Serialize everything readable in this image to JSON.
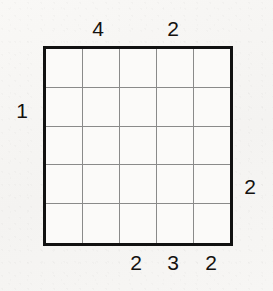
{
  "puzzle": {
    "type": "skyscrapers-grid",
    "grid": {
      "rows": 5,
      "columns": 5,
      "cells": [
        [
          "",
          "",
          "",
          "",
          ""
        ],
        [
          "",
          "",
          "",
          "",
          ""
        ],
        [
          "",
          "",
          "",
          "",
          ""
        ],
        [
          "",
          "",
          "",
          "",
          ""
        ],
        [
          "",
          "",
          "",
          "",
          ""
        ]
      ]
    },
    "clues": {
      "top": [
        {
          "column": 2,
          "value": "4"
        },
        {
          "column": 4,
          "value": "2"
        }
      ],
      "bottom": [
        {
          "column": 3,
          "value": "2"
        },
        {
          "column": 4,
          "value": "3"
        },
        {
          "column": 5,
          "value": "2"
        }
      ],
      "left": [
        {
          "row": 2,
          "value": "1"
        }
      ],
      "right": [
        {
          "row": 4,
          "value": "2"
        }
      ]
    },
    "colors": {
      "background": "#f7f6f4",
      "border": "#111111",
      "gridline": "#8a8a8a",
      "text": "#14110f",
      "cell_fill": "#fbfaf9"
    }
  }
}
